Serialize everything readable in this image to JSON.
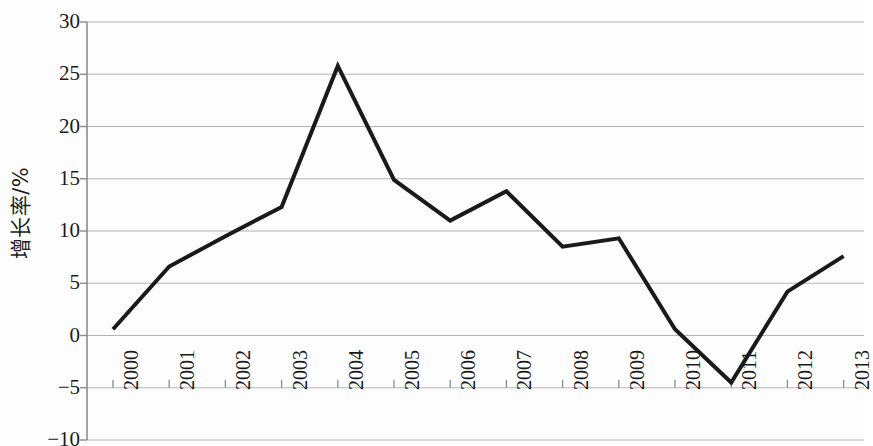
{
  "chart_data": {
    "type": "line",
    "title": "",
    "subtitle": "",
    "xlabel": "",
    "ylabel": "增长率/%",
    "categories": [
      "2000",
      "2001",
      "2002",
      "2003",
      "2004",
      "2005",
      "2006",
      "2007",
      "2008",
      "2009",
      "2010",
      "2011",
      "2012",
      "2013"
    ],
    "values": [
      0.6,
      6.6,
      9.5,
      12.3,
      25.8,
      14.9,
      11.0,
      13.8,
      8.5,
      9.3,
      0.6,
      -4.5,
      4.2,
      7.6
    ],
    "series": [
      {
        "name": "增长率/%",
        "values": [
          0.6,
          6.6,
          9.5,
          12.3,
          25.8,
          14.9,
          11.0,
          13.8,
          8.5,
          9.3,
          0.6,
          -4.5,
          4.2,
          7.6
        ]
      }
    ],
    "ylim": [
      -10,
      30
    ],
    "yticks": [
      -10,
      -5,
      0,
      5,
      10,
      15,
      20,
      25,
      30
    ],
    "ytick_labels": [
      "−10",
      "−5",
      "0",
      "5",
      "10",
      "15",
      "20",
      "25",
      "30"
    ],
    "xtick_labels": [
      "2000",
      "2001",
      "2002",
      "2003",
      "2004",
      "2005",
      "2006",
      "2007",
      "2008",
      "2009",
      "2010",
      "2011",
      "2012",
      "2013"
    ],
    "grid": true,
    "grid_axis": "y",
    "legend": false,
    "legend_position": "none",
    "line_color": "#1a1a1a",
    "line_width": 4,
    "markers": false,
    "grid_color": "#b4b4b4",
    "axis_color": "#8c8c8c",
    "background_color": "#fdfdfd"
  },
  "axis": {
    "y_title": "增长率/%"
  }
}
